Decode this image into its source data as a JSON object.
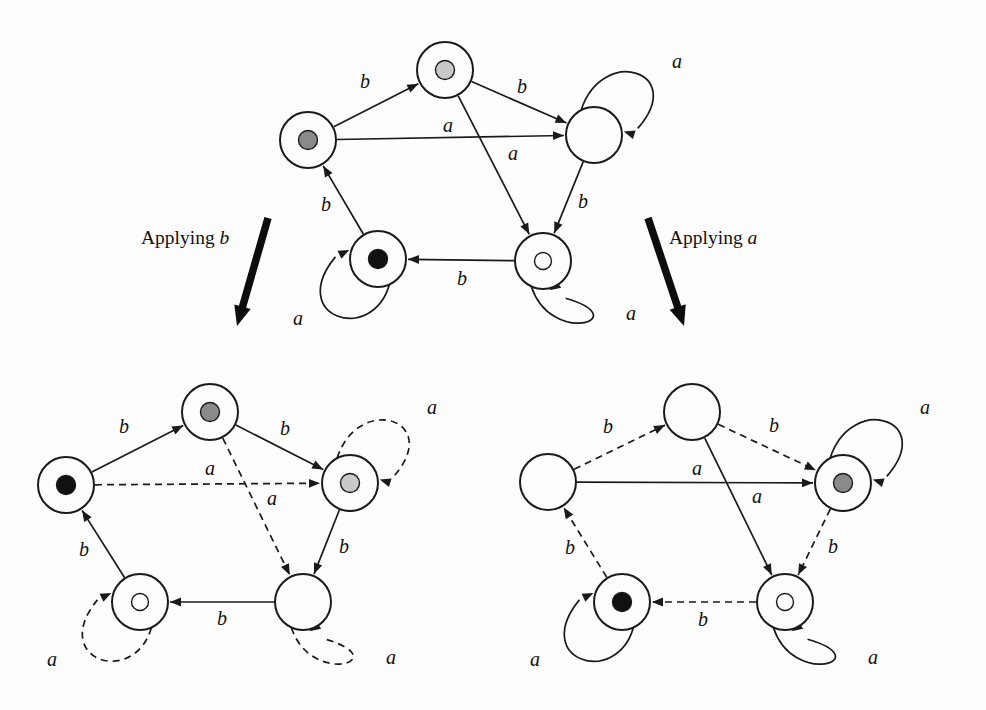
{
  "figure": {
    "background_color": "#fdfdfd",
    "ink_color": "#1a1a1a",
    "alphabet": [
      "a",
      "b"
    ],
    "marker_colors": {
      "black": "#111111",
      "medium_gray": "#8a8a8a",
      "light_gray": "#c9c9c9",
      "hollow": "#fdfdfd",
      "empty": "none"
    }
  },
  "captions": [
    {
      "id": "applying-b",
      "prefix": "Applying ",
      "symbol": "b",
      "x": 185,
      "y": 238
    },
    {
      "id": "applying-a",
      "prefix": "Applying ",
      "symbol": "a",
      "x": 713,
      "y": 238
    }
  ],
  "big_arrows": [
    {
      "id": "arrow-left",
      "x1": 268,
      "y1": 218,
      "x2": 237,
      "y2": 326
    },
    {
      "id": "arrow-right",
      "x1": 648,
      "y1": 218,
      "x2": 684,
      "y2": 326
    }
  ],
  "automata": [
    {
      "id": "top",
      "name": "source-automaton",
      "nodes": [
        {
          "id": "n-left",
          "label": "left",
          "cx": 308,
          "cy": 140,
          "r": 28,
          "marker": "medium_gray"
        },
        {
          "id": "n-top",
          "label": "top",
          "cx": 445,
          "cy": 70,
          "r": 28,
          "marker": "light_gray"
        },
        {
          "id": "n-right",
          "label": "right",
          "cx": 594,
          "cy": 135,
          "r": 28,
          "marker": "empty"
        },
        {
          "id": "n-botl",
          "label": "bottom-left",
          "cx": 378,
          "cy": 259,
          "r": 28,
          "marker": "black"
        },
        {
          "id": "n-botr",
          "label": "bottom-right",
          "cx": 543,
          "cy": 261,
          "r": 28,
          "marker": "hollow"
        }
      ],
      "edges": [
        {
          "from": "n-left",
          "to": "n-top",
          "label": "b",
          "style": "solid",
          "lx": 365,
          "ly": 83
        },
        {
          "from": "n-top",
          "to": "n-right",
          "label": "b",
          "style": "solid",
          "lx": 522,
          "ly": 88
        },
        {
          "from": "n-left",
          "to": "n-right",
          "label": "a",
          "style": "solid",
          "lx": 448,
          "ly": 127
        },
        {
          "from": "n-top",
          "to": "n-botr",
          "label": "a",
          "style": "solid",
          "lx": 513,
          "ly": 155
        },
        {
          "from": "n-right",
          "to": "n-botr",
          "label": "b",
          "style": "solid",
          "lx": 583,
          "ly": 203
        },
        {
          "from": "n-botr",
          "to": "n-botl",
          "label": "b",
          "style": "solid",
          "lx": 462,
          "ly": 280
        },
        {
          "from": "n-botl",
          "to": "n-left",
          "label": "b",
          "style": "solid",
          "lx": 326,
          "ly": 206
        }
      ],
      "self_loops": [
        {
          "node": "n-right",
          "label": "a",
          "style": "solid",
          "dir": "up-right",
          "lx": 677,
          "ly": 63
        },
        {
          "node": "n-botl",
          "label": "a",
          "style": "solid",
          "dir": "down-left",
          "lx": 298,
          "ly": 320
        },
        {
          "node": "n-botr",
          "label": "a",
          "style": "solid",
          "dir": "down-right",
          "lx": 631,
          "ly": 315
        }
      ]
    },
    {
      "id": "bottom-left",
      "name": "automaton-after-applying-b",
      "nodes": [
        {
          "id": "n-left",
          "label": "left",
          "cx": 66,
          "cy": 485,
          "r": 28,
          "marker": "black"
        },
        {
          "id": "n-top",
          "label": "top",
          "cx": 210,
          "cy": 412,
          "r": 28,
          "marker": "medium_gray"
        },
        {
          "id": "n-right",
          "label": "right",
          "cx": 350,
          "cy": 483,
          "r": 28,
          "marker": "light_gray"
        },
        {
          "id": "n-botl",
          "label": "bottom-left",
          "cx": 140,
          "cy": 602,
          "r": 28,
          "marker": "hollow"
        },
        {
          "id": "n-botr",
          "label": "bottom-right",
          "cx": 303,
          "cy": 602,
          "r": 28,
          "marker": "empty"
        }
      ],
      "edges": [
        {
          "from": "n-left",
          "to": "n-top",
          "label": "b",
          "style": "solid",
          "lx": 124,
          "ly": 428
        },
        {
          "from": "n-top",
          "to": "n-right",
          "label": "b",
          "style": "solid",
          "lx": 285,
          "ly": 430
        },
        {
          "from": "n-left",
          "to": "n-right",
          "label": "a",
          "style": "dashed",
          "lx": 210,
          "ly": 470
        },
        {
          "from": "n-top",
          "to": "n-botr",
          "label": "a",
          "style": "dashed",
          "lx": 272,
          "ly": 500
        },
        {
          "from": "n-right",
          "to": "n-botr",
          "label": "b",
          "style": "solid",
          "lx": 344,
          "ly": 548
        },
        {
          "from": "n-botr",
          "to": "n-botl",
          "label": "b",
          "style": "solid",
          "lx": 222,
          "ly": 620
        },
        {
          "from": "n-botl",
          "to": "n-left",
          "label": "b",
          "style": "solid",
          "lx": 84,
          "ly": 551
        }
      ],
      "self_loops": [
        {
          "node": "n-right",
          "label": "a",
          "style": "dashed",
          "dir": "up-right",
          "lx": 432,
          "ly": 409
        },
        {
          "node": "n-botl",
          "label": "a",
          "style": "dashed",
          "dir": "down-left",
          "lx": 52,
          "ly": 661
        },
        {
          "node": "n-botr",
          "label": "a",
          "style": "dashed",
          "dir": "down-right",
          "lx": 391,
          "ly": 659
        }
      ]
    },
    {
      "id": "bottom-right",
      "name": "automaton-after-applying-a",
      "nodes": [
        {
          "id": "n-left",
          "label": "left",
          "cx": 548,
          "cy": 482,
          "r": 28,
          "marker": "empty"
        },
        {
          "id": "n-top",
          "label": "top",
          "cx": 692,
          "cy": 412,
          "r": 28,
          "marker": "empty"
        },
        {
          "id": "n-right",
          "label": "right",
          "cx": 843,
          "cy": 483,
          "r": 28,
          "marker": "medium_gray"
        },
        {
          "id": "n-botl",
          "label": "bottom-left",
          "cx": 622,
          "cy": 602,
          "r": 28,
          "marker": "black"
        },
        {
          "id": "n-botr",
          "label": "bottom-right",
          "cx": 785,
          "cy": 602,
          "r": 28,
          "marker": "hollow"
        }
      ],
      "edges": [
        {
          "from": "n-left",
          "to": "n-top",
          "label": "b",
          "style": "dashed",
          "lx": 608,
          "ly": 428
        },
        {
          "from": "n-top",
          "to": "n-right",
          "label": "b",
          "style": "dashed",
          "lx": 774,
          "ly": 427
        },
        {
          "from": "n-left",
          "to": "n-right",
          "label": "a",
          "style": "solid",
          "lx": 697,
          "ly": 470
        },
        {
          "from": "n-top",
          "to": "n-botr",
          "label": "a",
          "style": "solid",
          "lx": 757,
          "ly": 498
        },
        {
          "from": "n-right",
          "to": "n-botr",
          "label": "b",
          "style": "dashed",
          "lx": 833,
          "ly": 548
        },
        {
          "from": "n-botr",
          "to": "n-botl",
          "label": "b",
          "style": "dashed",
          "lx": 703,
          "ly": 621
        },
        {
          "from": "n-botl",
          "to": "n-left",
          "label": "b",
          "style": "dashed",
          "lx": 570,
          "ly": 549
        }
      ],
      "self_loops": [
        {
          "node": "n-right",
          "label": "a",
          "style": "solid",
          "dir": "up-right",
          "lx": 925,
          "ly": 409
        },
        {
          "node": "n-botl",
          "label": "a",
          "style": "solid",
          "dir": "down-left",
          "lx": 535,
          "ly": 661
        },
        {
          "node": "n-botr",
          "label": "a",
          "style": "solid",
          "dir": "down-right",
          "lx": 873,
          "ly": 659
        }
      ]
    }
  ]
}
